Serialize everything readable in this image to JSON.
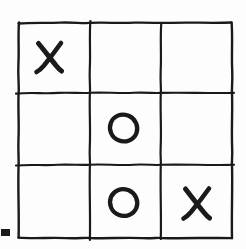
{
  "board": {
    "title": "Tic-Tac-Toe",
    "style": "hand-drawn",
    "rows": 3,
    "columns": 3,
    "ink_color": "#1a1a1a",
    "background_color": "#fdfdfd",
    "grid": {
      "left": 18,
      "top": 22,
      "right": 232,
      "bottom": 238,
      "vertical_lines_x": [
        90,
        161
      ],
      "horizontal_lines_y": [
        93,
        165
      ],
      "stroke_width": 2.2
    },
    "cells": [
      {
        "index": 0,
        "row": 0,
        "col": 0,
        "name": "top-left",
        "mark": "X",
        "empty": false
      },
      {
        "index": 1,
        "row": 0,
        "col": 1,
        "name": "top-center",
        "mark": "",
        "empty": true
      },
      {
        "index": 2,
        "row": 0,
        "col": 2,
        "name": "top-right",
        "mark": "",
        "empty": true
      },
      {
        "index": 3,
        "row": 1,
        "col": 0,
        "name": "middle-left",
        "mark": "",
        "empty": true
      },
      {
        "index": 4,
        "row": 1,
        "col": 1,
        "name": "middle-center",
        "mark": "O",
        "empty": false
      },
      {
        "index": 5,
        "row": 1,
        "col": 2,
        "name": "middle-right",
        "mark": "",
        "empty": true
      },
      {
        "index": 6,
        "row": 2,
        "col": 0,
        "name": "bottom-left",
        "mark": "",
        "empty": true
      },
      {
        "index": 7,
        "row": 2,
        "col": 1,
        "name": "bottom-center",
        "mark": "O",
        "empty": false
      },
      {
        "index": 8,
        "row": 2,
        "col": 2,
        "name": "bottom-right",
        "mark": "X",
        "empty": false
      }
    ],
    "mark_labels": {
      "x": "X",
      "o": "O",
      "empty": ""
    }
  },
  "corner_mark": {
    "name": "dash-mark",
    "shape": "filled-rectangle",
    "x": 1,
    "y": 229,
    "width": 9,
    "height": 7,
    "color": "#1a1a1a"
  }
}
